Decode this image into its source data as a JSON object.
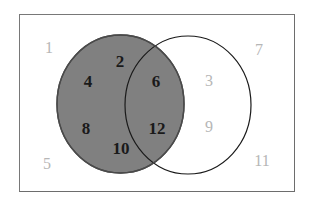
{
  "figure": {
    "frame_label": "universal-set-rectangle"
  },
  "colors": {
    "shaded_fill": "#808080",
    "shaded_stroke": "#4a4a4a",
    "unshaded_fill": "#ffffff",
    "unshaded_stroke": "#1a1a1a",
    "frame_stroke": "#6d6d6d",
    "background": "#ffffff",
    "label_inside": "#1a1a1a",
    "label_outside": "#b6b6b6"
  },
  "circles": {
    "left": {
      "name": "left-set-circle",
      "cx": 120.5,
      "cy": 104,
      "rx": 63.5,
      "ry": 69,
      "shaded": true
    },
    "right": {
      "name": "right-set-circle",
      "cx": 188.0,
      "cy": 105,
      "rx": 63.0,
      "ry": 69,
      "shaded": false
    }
  },
  "labels": {
    "outside_left": [
      {
        "text": "1",
        "x": 49,
        "y": 48,
        "shaded": false
      },
      {
        "text": "5",
        "x": 47,
        "y": 164,
        "shaded": false
      }
    ],
    "left_only": [
      {
        "text": "2",
        "x": 120,
        "y": 61,
        "shaded": true
      },
      {
        "text": "4",
        "x": 88,
        "y": 81,
        "shaded": true
      },
      {
        "text": "8",
        "x": 86,
        "y": 128,
        "shaded": true
      },
      {
        "text": "10",
        "x": 121,
        "y": 148,
        "shaded": true
      }
    ],
    "intersection": [
      {
        "text": "6",
        "x": 156,
        "y": 81,
        "shaded": true
      },
      {
        "text": "12",
        "x": 157,
        "y": 128,
        "shaded": true
      }
    ],
    "right_only": [
      {
        "text": "3",
        "x": 209,
        "y": 81,
        "shaded": false
      },
      {
        "text": "9",
        "x": 209,
        "y": 127,
        "shaded": false
      }
    ],
    "outside_right": [
      {
        "text": "7",
        "x": 259,
        "y": 50,
        "shaded": false
      },
      {
        "text": "11",
        "x": 262,
        "y": 161,
        "shaded": false
      }
    ]
  }
}
